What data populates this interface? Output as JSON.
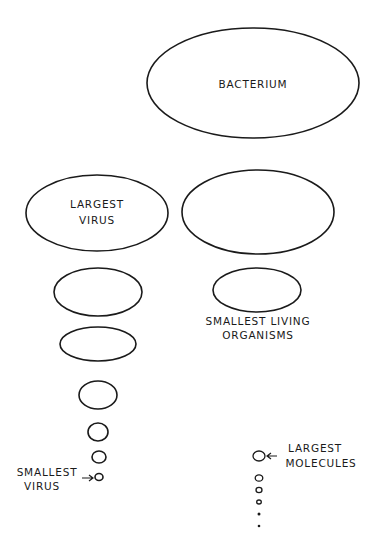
{
  "diagram": {
    "title": "",
    "labels": {
      "bacterium": "BACTERIUM",
      "largest_virus_line1": "LARGEST",
      "largest_virus_line2": "VIRUS",
      "smallest_living_line1": "SMALLEST LIVING",
      "smallest_living_line2": "ORGANISMS",
      "smallest_virus_line1": "SMALLEST",
      "smallest_virus_line2": "VIRUS",
      "largest_molecules_line1": "LARGEST",
      "largest_molecules_line2": "MOLECULES"
    },
    "shapes": {
      "bacterium": {
        "cx": 253,
        "cy": 83,
        "rx": 106,
        "ry": 55
      },
      "largest_virus": {
        "cx": 97,
        "cy": 213,
        "rx": 71,
        "ry": 38
      },
      "organism_large": {
        "cx": 258,
        "cy": 212,
        "rx": 76,
        "ry": 42
      },
      "smallest_living": {
        "cx": 257,
        "cy": 290,
        "rx": 44,
        "ry": 22
      },
      "virus_series": [
        {
          "cx": 98,
          "cy": 292,
          "rx": 44,
          "ry": 24
        },
        {
          "cx": 98,
          "cy": 344,
          "rx": 38,
          "ry": 17
        },
        {
          "cx": 98,
          "cy": 395,
          "rx": 19,
          "ry": 14
        },
        {
          "cx": 98,
          "cy": 432,
          "rx": 10,
          "ry": 9
        },
        {
          "cx": 99,
          "cy": 457,
          "rx": 7,
          "ry": 6
        },
        {
          "cx": 99,
          "cy": 477,
          "rx": 4,
          "ry": 3.5
        }
      ],
      "molecule_series": [
        {
          "cx": 259,
          "cy": 456,
          "rx": 6,
          "ry": 5
        },
        {
          "cx": 259,
          "cy": 478,
          "rx": 3.8,
          "ry": 3.2
        },
        {
          "cx": 259,
          "cy": 490,
          "rx": 3,
          "ry": 2.6
        },
        {
          "cx": 259,
          "cy": 502,
          "rx": 2.3,
          "ry": 2
        }
      ],
      "molecule_dots": [
        {
          "cx": 259,
          "cy": 514,
          "r": 1.5
        },
        {
          "cx": 259,
          "cy": 526,
          "r": 1.3
        }
      ]
    }
  }
}
